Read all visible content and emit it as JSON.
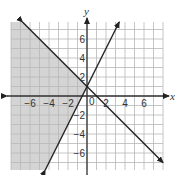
{
  "chart_data": {
    "type": "line",
    "title": "",
    "xlabel": "x",
    "ylabel": "y",
    "xlim": [
      -8,
      8
    ],
    "ylim": [
      -8,
      8
    ],
    "grid": true,
    "x_ticks": [
      -6,
      -4,
      -2,
      2,
      4,
      6
    ],
    "y_ticks": [
      6,
      4,
      2,
      -2,
      -4,
      -6
    ],
    "origin_label": "0",
    "series": [
      {
        "name": "y = -x + 1",
        "slope": -1,
        "intercept": 1,
        "style": "solid",
        "arrows": true
      },
      {
        "name": "y = 2x + 1",
        "slope": 2,
        "intercept": 1,
        "style": "solid",
        "arrows": true
      }
    ],
    "shaded_region": {
      "description": "y <= -x + 1 and y >= 2x + 1 (left of both lines)",
      "color": "#d4d4d4"
    }
  },
  "colors": {
    "grid": "#b8b8b8",
    "axis": "#333333",
    "line": "#222222",
    "shade": "#d4d4d4"
  }
}
